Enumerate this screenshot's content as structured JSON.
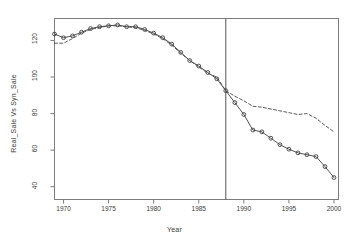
{
  "chart_data": {
    "type": "line",
    "title": "",
    "xlabel": "Year",
    "ylabel": "Real_Sale Vs Syn_Sale",
    "xlim": [
      1969,
      2000.5
    ],
    "ylim": [
      33,
      132
    ],
    "grid": false,
    "legend": "none",
    "xticks": [
      1970,
      1975,
      1980,
      1985,
      1990,
      1995,
      2000
    ],
    "xtick_labels": [
      "1970",
      "1975",
      "1980",
      "1985",
      "1990",
      "1995",
      "2000"
    ],
    "yticks": [
      40,
      60,
      80,
      100,
      120
    ],
    "ytick_labels": [
      "40",
      "60",
      "80",
      "100",
      "120"
    ],
    "annotations": [
      {
        "name": "forecast-split-line",
        "type": "vline",
        "x": 1988,
        "label": ""
      }
    ],
    "series": [
      {
        "name": "Real_Sale",
        "style": "solid",
        "marker": "circle",
        "color": "#404040",
        "x": [
          1969,
          1970,
          1971,
          1972,
          1973,
          1974,
          1975,
          1976,
          1977,
          1978,
          1979,
          1980,
          1981,
          1982,
          1983,
          1984,
          1985,
          1986,
          1987,
          1988,
          1989,
          1990,
          1991,
          1992,
          1993,
          1994,
          1995,
          1996,
          1997,
          1998,
          1999,
          2000
        ],
        "y": [
          123.5,
          121.5,
          122.5,
          124.5,
          126.5,
          127.5,
          128.0,
          128.5,
          127.5,
          127.5,
          126.0,
          124.0,
          121.5,
          118.0,
          113.5,
          109.0,
          106.0,
          102.5,
          99.0,
          92.5,
          86.0,
          79.5,
          71.0,
          70.0,
          66.5,
          63.0,
          60.5,
          58.5,
          57.5,
          56.5,
          51.0,
          45.0
        ]
      },
      {
        "name": "Syn_Sale",
        "style": "dashed",
        "marker": "none",
        "color": "#4a4a4a",
        "x": [
          1969,
          1970,
          1971,
          1972,
          1973,
          1974,
          1975,
          1976,
          1977,
          1978,
          1979,
          1980,
          1981,
          1982,
          1983,
          1984,
          1985,
          1986,
          1987,
          1988,
          1989,
          1990,
          1991,
          1992,
          1993,
          1994,
          1995,
          1996,
          1997,
          1998,
          1999,
          2000
        ],
        "y": [
          118.5,
          118.5,
          121.0,
          124.0,
          126.0,
          127.0,
          128.0,
          128.0,
          127.5,
          127.0,
          125.5,
          123.5,
          121.0,
          117.5,
          113.0,
          109.0,
          105.5,
          102.0,
          100.0,
          92.5,
          89.5,
          87.0,
          84.0,
          83.5,
          82.5,
          81.5,
          80.5,
          79.5,
          80.0,
          77.5,
          73.5,
          70.0
        ]
      }
    ]
  },
  "figure": {
    "background_color": "#ffffff",
    "axis_color": "#7d7d7d",
    "text_color": "#3a3a3a"
  }
}
